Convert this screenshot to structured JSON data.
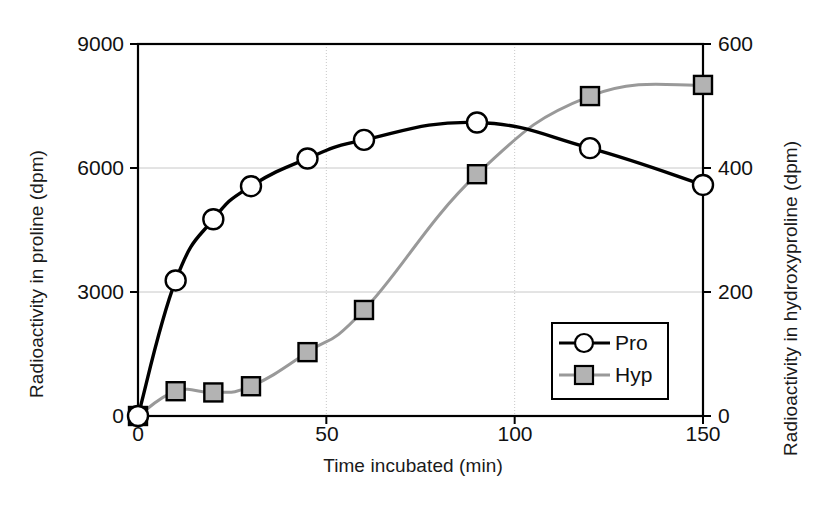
{
  "chart_data": {
    "type": "line",
    "title": "",
    "xlabel": "Time incubated (min)",
    "ylabel": "Radioactivity in proline (dpm)",
    "ylabel_right": "Radioactivity in hydroxyproline (dpm)",
    "xlim": [
      0,
      150
    ],
    "ylim": [
      0,
      9000
    ],
    "ylim_right": [
      0,
      600
    ],
    "xticks": [
      0,
      50,
      100,
      150
    ],
    "xtick_labels": [
      "0",
      "50",
      "100",
      "150"
    ],
    "yticks": [
      0,
      3000,
      6000,
      9000
    ],
    "ytick_labels": [
      "0",
      "3000",
      "6000",
      "9000"
    ],
    "yticks_right": [
      0,
      200,
      400,
      600
    ],
    "ytick_labels_right": [
      "0",
      "200",
      "400",
      "600"
    ],
    "grid": true,
    "legend_position": "lower right",
    "x": [
      0,
      10,
      20,
      30,
      45,
      60,
      90,
      120,
      150
    ],
    "series": [
      {
        "name": "Pro",
        "axis": "left",
        "marker": "circle",
        "marker_fill": "#ffffff",
        "line_color": "#000000",
        "values": [
          0,
          3280,
          4760,
          5560,
          6230,
          6680,
          7100,
          6480,
          5590
        ]
      },
      {
        "name": "Hyp",
        "axis": "right",
        "marker": "square",
        "marker_fill": "#b3b3b3",
        "line_color": "#999999",
        "values": [
          0,
          40,
          38,
          48,
          103,
          171,
          390,
          516,
          534
        ]
      }
    ]
  },
  "legend": {
    "entries": [
      {
        "label": "Pro",
        "icon": "circle-marker-icon"
      },
      {
        "label": "Hyp",
        "icon": "square-marker-icon"
      }
    ]
  },
  "colors": {
    "pro_line": "#000000",
    "hyp_line": "#999999",
    "hyp_fill": "#b3b3b3",
    "axis": "#000000",
    "grid": "#c8c8c8",
    "background": "#ffffff"
  }
}
